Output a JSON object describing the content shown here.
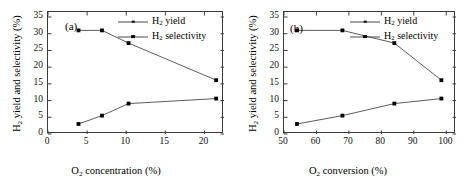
{
  "figure": {
    "background": "#ffffff",
    "line_color": "#4a4a4a",
    "marker_color": "#000000",
    "axis_color": "#3a3a3a"
  },
  "panels": [
    {
      "id": "a",
      "letter": "(a)",
      "xlabel_prefix": "O",
      "xlabel_sub": "2",
      "xlabel_suffix": " concentration (%)",
      "ylabel_prefix": "H",
      "ylabel_sub": "2",
      "ylabel_suffix": " yield and selectivity (%)",
      "xticks": [
        "0",
        "5",
        "10",
        "15",
        "20"
      ],
      "yticks": [
        "0",
        "5",
        "10",
        "15",
        "20",
        "25",
        "30",
        "35"
      ]
    },
    {
      "id": "b",
      "letter": "(b)",
      "xlabel_prefix": "O",
      "xlabel_sub": "2",
      "xlabel_suffix": " conversion (%)",
      "ylabel_prefix": "H",
      "ylabel_sub": "2",
      "ylabel_suffix": " yield and selectivity (%)",
      "xticks": [
        "50",
        "60",
        "70",
        "80",
        "90",
        "100"
      ],
      "yticks": [
        "0",
        "5",
        "10",
        "15",
        "20",
        "25",
        "30",
        "35"
      ]
    }
  ],
  "legend": {
    "entries": [
      {
        "label_prefix": "H",
        "label_sub": "2",
        "label_suffix": " yield",
        "marker": "small-square"
      },
      {
        "label_prefix": "H",
        "label_sub": "2",
        "label_suffix": " selectivity",
        "marker": "big-square"
      }
    ]
  },
  "chart_data": [
    {
      "type": "line",
      "panel": "a",
      "title": "(a)",
      "xlabel": "O2 concentration (%)",
      "ylabel": "H2 yield and selectivity (%)",
      "xlim": [
        0,
        22.5
      ],
      "ylim": [
        0,
        36.5
      ],
      "xticks": [
        0,
        5,
        10,
        15,
        20
      ],
      "yticks": [
        0,
        5,
        10,
        15,
        20,
        25,
        30,
        35
      ],
      "grid": false,
      "legend_position": "top-right",
      "series": [
        {
          "name": "H2 selectivity",
          "x": [
            3.9,
            6.9,
            10.3,
            21.5
          ],
          "values": [
            31.0,
            31.0,
            27.2,
            16.1
          ]
        },
        {
          "name": "H2 yield",
          "x": [
            3.9,
            6.9,
            10.3,
            21.5
          ],
          "values": [
            3.0,
            5.5,
            9.1,
            10.6
          ]
        }
      ]
    },
    {
      "type": "line",
      "panel": "b",
      "title": "(b)",
      "xlabel": "O2 conversion (%)",
      "ylabel": "H2 yield and selectivity (%)",
      "xlim": [
        50,
        103
      ],
      "ylim": [
        0,
        36.5
      ],
      "xticks": [
        50,
        60,
        70,
        80,
        90,
        100
      ],
      "yticks": [
        0,
        5,
        10,
        15,
        20,
        25,
        30,
        35
      ],
      "grid": false,
      "legend_position": "top-right",
      "series": [
        {
          "name": "H2 selectivity",
          "x": [
            54.0,
            68.0,
            84.0,
            98.5
          ],
          "values": [
            31.0,
            31.0,
            27.2,
            16.1
          ]
        },
        {
          "name": "H2 yield",
          "x": [
            54.0,
            68.0,
            84.0,
            98.5
          ],
          "values": [
            3.0,
            5.5,
            9.1,
            10.6
          ]
        }
      ]
    }
  ]
}
